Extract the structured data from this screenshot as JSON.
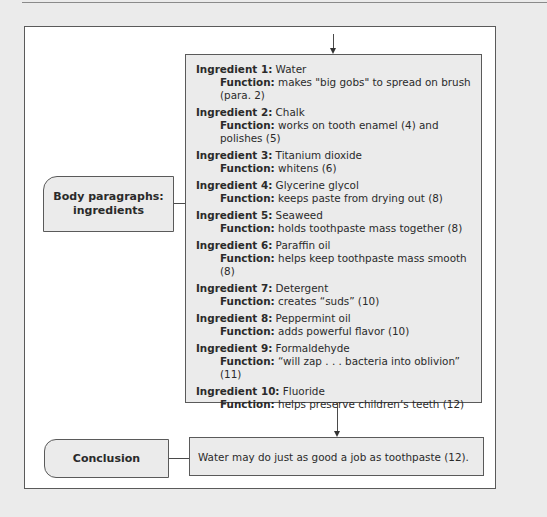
{
  "diagram": {
    "body_label": "Body paragraphs: ingredients",
    "conclusion_label": "Conclusion",
    "conclusion_text": "Water may do just as good a job as toothpaste (12).",
    "ingredients": [
      {
        "label": "Ingredient 1:",
        "name": "Water",
        "function_label": "Function:",
        "function": "makes \"big gobs\" to spread on brush (para. 2)"
      },
      {
        "label": "Ingredient 2:",
        "name": "Chalk",
        "function_label": "Function:",
        "function": "works on tooth enamel (4) and polishes (5)"
      },
      {
        "label": "Ingredient 3:",
        "name": "Titanium dioxide",
        "function_label": "Function:",
        "function": "whitens (6)"
      },
      {
        "label": "Ingredient 4:",
        "name": "Glycerine glycol",
        "function_label": "Function:",
        "function": "keeps paste from drying out (8)"
      },
      {
        "label": "Ingredient 5:",
        "name": "Seaweed",
        "function_label": "Function:",
        "function": "holds toothpaste mass together (8)"
      },
      {
        "label": "Ingredient 6:",
        "name": "Paraffin oil",
        "function_label": "Function:",
        "function": "helps keep toothpaste mass smooth (8)"
      },
      {
        "label": "Ingredient 7:",
        "name": "Detergent",
        "function_label": "Function:",
        "function": "creates “suds” (10)"
      },
      {
        "label": "Ingredient 8:",
        "name": "Peppermint oil",
        "function_label": "Function:",
        "function": "adds powerful flavor (10)"
      },
      {
        "label": "Ingredient 9:",
        "name": "Formaldehyde",
        "function_label": "Function:",
        "function": "“will zap . . . bacteria into oblivion” (11)"
      },
      {
        "label": "Ingredient 10:",
        "name": "Fluoride",
        "function_label": "Function:",
        "function": "helps preserve children’s teeth (12)"
      }
    ]
  }
}
